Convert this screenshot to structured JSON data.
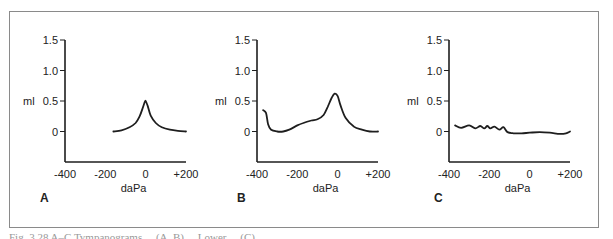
{
  "figure": {
    "caption_partial": "Fig. 3.28 A–C Tympanograms ... (A, B) ... Lower ... (C) ..."
  },
  "chart_data": [
    {
      "type": "line",
      "panel": "A",
      "xlabel": "daPa",
      "ylabel": "ml",
      "x_ticks": [
        "-400",
        "-200",
        "0",
        "+200"
      ],
      "y_ticks": [
        "0",
        "0.5",
        "1.0",
        "1.5"
      ],
      "xlim": [
        -400,
        200
      ],
      "ylim": [
        -0.5,
        1.5
      ],
      "grid": false,
      "series": [
        {
          "name": "A",
          "x": [
            -160,
            -120,
            -80,
            -50,
            -30,
            -15,
            -5,
            0,
            10,
            25,
            50,
            80,
            120,
            160,
            200
          ],
          "y": [
            0.0,
            0.02,
            0.07,
            0.14,
            0.25,
            0.38,
            0.48,
            0.5,
            0.42,
            0.26,
            0.14,
            0.07,
            0.03,
            0.01,
            0.0
          ]
        }
      ]
    },
    {
      "type": "line",
      "panel": "B",
      "xlabel": "daPa",
      "ylabel": "ml",
      "x_ticks": [
        "-400",
        "-200",
        "0",
        "+200"
      ],
      "y_ticks": [
        "0",
        "0.5",
        "1.0",
        "1.5"
      ],
      "xlim": [
        -400,
        200
      ],
      "ylim": [
        -0.5,
        1.5
      ],
      "grid": false,
      "series": [
        {
          "name": "B",
          "x": [
            -370,
            -355,
            -345,
            -330,
            -300,
            -270,
            -240,
            -200,
            -170,
            -130,
            -100,
            -70,
            -50,
            -30,
            -15,
            0,
            15,
            40,
            80,
            120,
            160,
            200
          ],
          "y": [
            0.35,
            0.3,
            0.12,
            0.03,
            0.0,
            0.0,
            0.03,
            0.1,
            0.14,
            0.18,
            0.2,
            0.27,
            0.4,
            0.55,
            0.62,
            0.58,
            0.42,
            0.22,
            0.08,
            0.03,
            0.0,
            0.0
          ]
        }
      ]
    },
    {
      "type": "line",
      "panel": "C",
      "xlabel": "daPa",
      "ylabel": "ml",
      "x_ticks": [
        "-400",
        "-200",
        "0",
        "+200"
      ],
      "y_ticks": [
        "0",
        "0.5",
        "1.0",
        "1.5"
      ],
      "xlim": [
        -400,
        200
      ],
      "ylim": [
        -0.5,
        1.5
      ],
      "grid": false,
      "series": [
        {
          "name": "C",
          "x": [
            -370,
            -340,
            -300,
            -270,
            -245,
            -225,
            -210,
            -195,
            -175,
            -150,
            -130,
            -110,
            -80,
            -40,
            0,
            50,
            100,
            150,
            180,
            200
          ],
          "y": [
            0.1,
            0.06,
            0.1,
            0.05,
            0.09,
            0.05,
            0.09,
            0.05,
            0.08,
            0.03,
            0.07,
            -0.01,
            -0.03,
            -0.03,
            -0.02,
            -0.01,
            -0.02,
            -0.04,
            -0.03,
            0.0
          ]
        }
      ]
    }
  ],
  "axes": {
    "xlabel": "daPa",
    "ylabel": "ml"
  },
  "panels": [
    {
      "label": "A",
      "ylabel": "ml",
      "xlabel": "daPa",
      "x_ticks": [
        "-400",
        "-200",
        "0",
        "+200"
      ],
      "y_ticks": [
        "0",
        "0.5",
        "1.0",
        "1.5"
      ]
    },
    {
      "label": "B",
      "ylabel": "ml",
      "xlabel": "daPa",
      "x_ticks": [
        "-400",
        "-200",
        "0",
        "+200"
      ],
      "y_ticks": [
        "0",
        "0.5",
        "1.0",
        "1.5"
      ]
    },
    {
      "label": "C",
      "ylabel": "ml",
      "xlabel": "daPa",
      "x_ticks": [
        "-400",
        "-200",
        "0",
        "+200"
      ],
      "y_ticks": [
        "0",
        "0.5",
        "1.0",
        "1.5"
      ]
    }
  ],
  "style": {
    "line_color": "#1e1e1e",
    "axis_color": "#1e1e1e",
    "frame_color": "#8a8a8a"
  }
}
